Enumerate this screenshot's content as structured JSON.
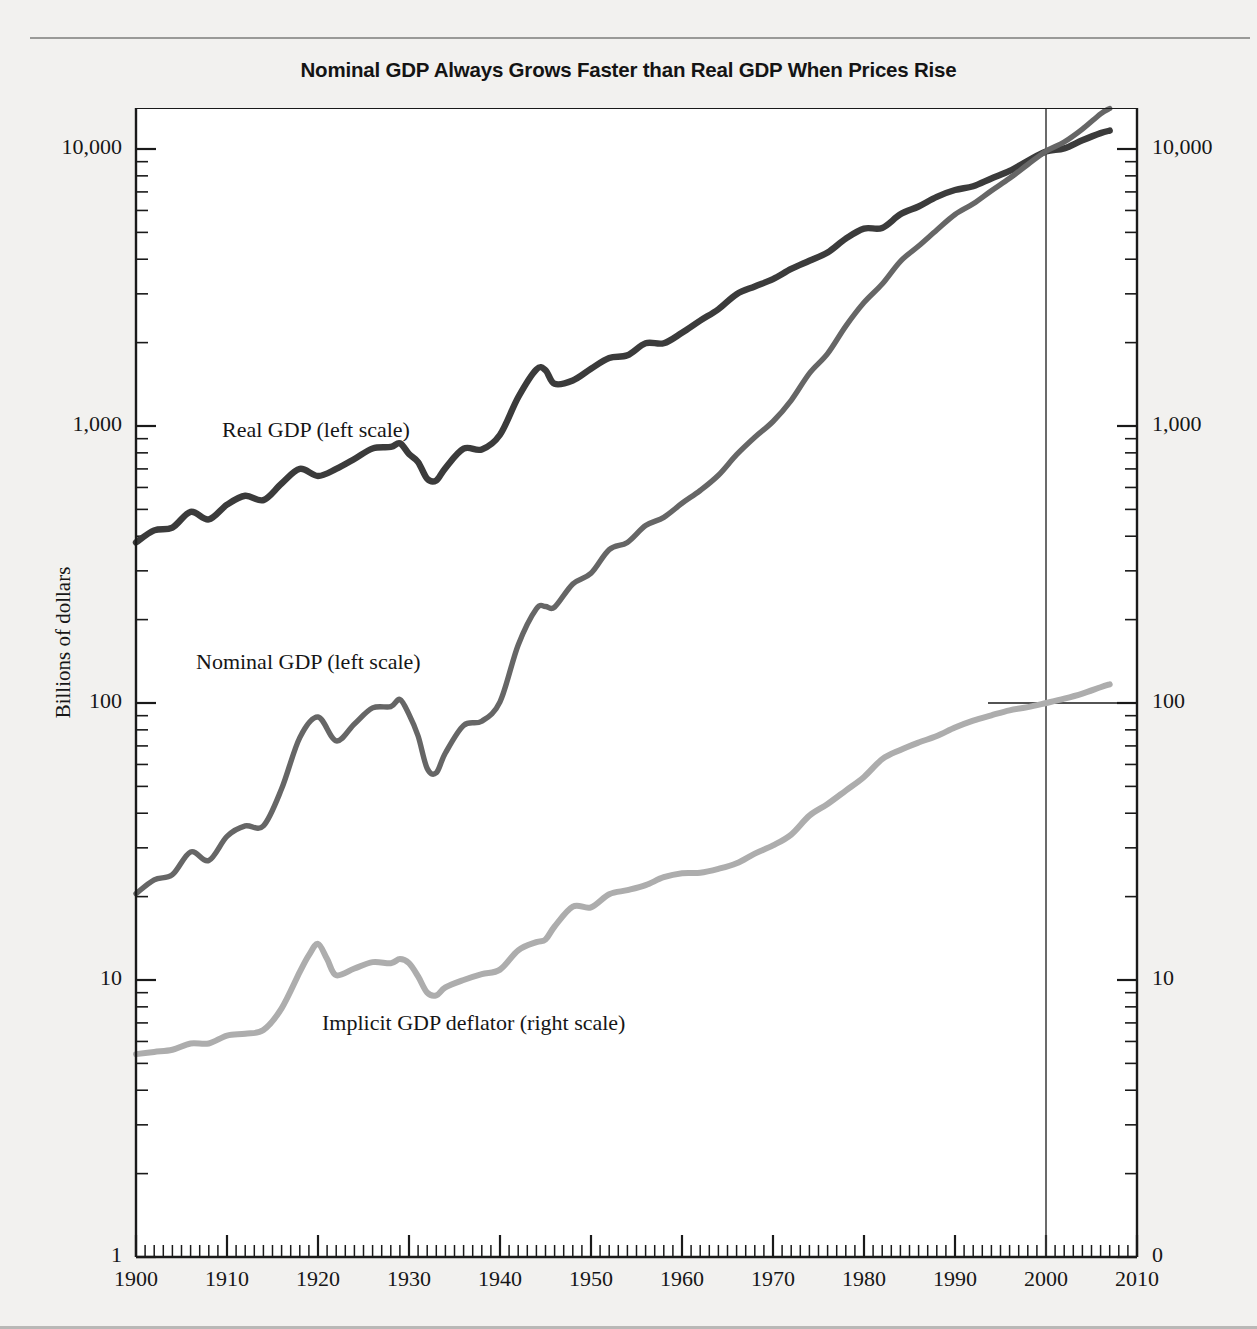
{
  "chart_data": {
    "type": "line",
    "title": "Nominal GDP Always Grows Faster than Real GDP When Prices Rise",
    "xlabel": "",
    "ylabel": "Billions of dollars",
    "ylabel_right": "Price index (the year 2000=100)",
    "x_scale": "linear",
    "y_scale": "log",
    "xlim": [
      1900,
      2010
    ],
    "ylim_left": [
      1,
      20000
    ],
    "ylim_right": [
      0,
      20000
    ],
    "grid": false,
    "legend_position": "inline-annotations",
    "xticks": [
      "1900",
      "1910",
      "1920",
      "1930",
      "1940",
      "1950",
      "1960",
      "1970",
      "1980",
      "1990",
      "2000",
      "2010"
    ],
    "xtick_values": [
      1900,
      1910,
      1920,
      1930,
      1940,
      1950,
      1960,
      1970,
      1980,
      1990,
      2000,
      2010
    ],
    "yticks_left": [
      "1",
      "10",
      "100",
      "1,000",
      "10,000"
    ],
    "ytick_values_left": [
      1,
      10,
      100,
      1000,
      10000
    ],
    "yticks_right": [
      "0",
      "10",
      "100",
      "1,000",
      "10,000"
    ],
    "ytick_values_right": [
      1,
      10,
      100,
      1000,
      10000
    ],
    "minor_ticks": "log decade subdivisions on both vertical axes; annual ticks on horizontal axis",
    "annotations": [
      {
        "name": "reference-line-2000",
        "type": "vline",
        "x": 2000,
        "label": ""
      },
      {
        "name": "reference-line-100",
        "type": "hline",
        "y": 100,
        "axis": "right",
        "label": ""
      }
    ],
    "series": [
      {
        "name": "Real GDP (left scale)",
        "label": "Real GDP (left scale)",
        "color": "#3b3b3b",
        "axis": "left",
        "units": "Billions of dollars",
        "x": [
          1900,
          1902,
          1904,
          1906,
          1908,
          1910,
          1912,
          1914,
          1916,
          1918,
          1920,
          1922,
          1924,
          1926,
          1928,
          1929,
          1930,
          1931,
          1932,
          1933,
          1934,
          1936,
          1938,
          1940,
          1942,
          1944,
          1945,
          1946,
          1948,
          1950,
          1952,
          1954,
          1956,
          1958,
          1960,
          1962,
          1964,
          1966,
          1968,
          1970,
          1972,
          1974,
          1976,
          1978,
          1980,
          1982,
          1984,
          1986,
          1988,
          1990,
          1992,
          1994,
          1996,
          1998,
          2000,
          2002,
          2004,
          2006,
          2007
        ],
        "y": [
          380,
          420,
          430,
          490,
          460,
          520,
          560,
          540,
          620,
          700,
          660,
          700,
          760,
          830,
          840,
          866,
          792,
          741,
          645,
          636,
          705,
          828,
          823,
          930,
          1270,
          1600,
          1590,
          1420,
          1460,
          1610,
          1760,
          1800,
          1990,
          1990,
          2170,
          2400,
          2640,
          2990,
          3190,
          3390,
          3690,
          3950,
          4230,
          4750,
          5160,
          5190,
          5810,
          6200,
          6720,
          7110,
          7340,
          7830,
          8330,
          9060,
          9800,
          10050,
          10750,
          11410,
          11650
        ]
      },
      {
        "name": "Nominal GDP (left scale)",
        "label": "Nominal GDP (left scale)",
        "color": "#666666",
        "axis": "left",
        "units": "Billions of dollars",
        "x": [
          1900,
          1902,
          1904,
          1906,
          1908,
          1910,
          1912,
          1914,
          1916,
          1918,
          1920,
          1922,
          1924,
          1926,
          1928,
          1929,
          1930,
          1931,
          1932,
          1933,
          1934,
          1936,
          1938,
          1940,
          1942,
          1944,
          1945,
          1946,
          1948,
          1950,
          1952,
          1954,
          1956,
          1958,
          1960,
          1962,
          1964,
          1966,
          1968,
          1970,
          1972,
          1974,
          1976,
          1978,
          1980,
          1982,
          1984,
          1986,
          1988,
          1990,
          1992,
          1994,
          1996,
          1998,
          2000,
          2002,
          2004,
          2006,
          2007
        ],
        "y": [
          20.5,
          23,
          24,
          29,
          27,
          33,
          36,
          36,
          49,
          75,
          89,
          73,
          84,
          96,
          97,
          103,
          91,
          76,
          58,
          56,
          66,
          83,
          86,
          101,
          162,
          219,
          223,
          222,
          269,
          294,
          358,
          380,
          437,
          468,
          526,
          585,
          664,
          788,
          911,
          1038,
          1238,
          1549,
          1825,
          2294,
          2790,
          3255,
          3933,
          4463,
          5100,
          5800,
          6340,
          7070,
          7840,
          8790,
          9820,
          10600,
          11800,
          13400,
          14000
        ]
      },
      {
        "name": "Implicit GDP deflator (right scale)",
        "label": "Implicit GDP deflator (right scale)",
        "color": "#adadad",
        "axis": "right",
        "units": "Index, 2000 = 100",
        "x": [
          1900,
          1902,
          1904,
          1906,
          1908,
          1910,
          1912,
          1914,
          1916,
          1918,
          1919,
          1920,
          1921,
          1922,
          1924,
          1926,
          1928,
          1929,
          1930,
          1931,
          1932,
          1933,
          1934,
          1936,
          1938,
          1940,
          1942,
          1944,
          1945,
          1946,
          1948,
          1950,
          1952,
          1954,
          1956,
          1958,
          1960,
          1962,
          1964,
          1966,
          1968,
          1970,
          1972,
          1974,
          1976,
          1978,
          1980,
          1982,
          1984,
          1986,
          1988,
          1990,
          1992,
          1994,
          1996,
          1998,
          2000,
          2002,
          2004,
          2006,
          2007
        ],
        "y": [
          5.4,
          5.5,
          5.6,
          5.9,
          5.9,
          6.3,
          6.4,
          6.6,
          7.9,
          10.7,
          12.3,
          13.5,
          11.9,
          10.4,
          11.0,
          11.6,
          11.5,
          11.9,
          11.5,
          10.3,
          9.0,
          8.8,
          9.4,
          10.0,
          10.5,
          10.9,
          12.8,
          13.7,
          14.0,
          15.6,
          18.4,
          18.3,
          20.4,
          21.1,
          22.0,
          23.5,
          24.3,
          24.4,
          25.2,
          26.4,
          28.6,
          30.6,
          33.5,
          39.2,
          43.2,
          48.3,
          54.1,
          62.7,
          67.7,
          72.0,
          76.0,
          81.6,
          86.4,
          90.3,
          94.1,
          96.6,
          100.0,
          103.7,
          108.2,
          114.0,
          116.8
        ]
      }
    ]
  },
  "axes": {
    "left": {
      "title": "Billions of dollars",
      "ticks": [
        {
          "value": 10000,
          "label": "10,000"
        },
        {
          "value": 1000,
          "label": "1,000"
        },
        {
          "value": 100,
          "label": "100"
        },
        {
          "value": 10,
          "label": "10"
        },
        {
          "value": 1,
          "label": "1"
        }
      ]
    },
    "right": {
      "title": "Price index (the year 2000=100)",
      "ticks": [
        {
          "value": 10000,
          "label": "10,000"
        },
        {
          "value": 1000,
          "label": "1,000"
        },
        {
          "value": 100,
          "label": "100"
        },
        {
          "value": 10,
          "label": "10"
        },
        {
          "value": 1,
          "label": "0"
        }
      ]
    },
    "bottom": {
      "ticks": [
        {
          "value": 1900,
          "label": "1900"
        },
        {
          "value": 1910,
          "label": "1910"
        },
        {
          "value": 1920,
          "label": "1920"
        },
        {
          "value": 1930,
          "label": "1930"
        },
        {
          "value": 1940,
          "label": "1940"
        },
        {
          "value": 1950,
          "label": "1950"
        },
        {
          "value": 1960,
          "label": "1960"
        },
        {
          "value": 1970,
          "label": "1970"
        },
        {
          "value": 1980,
          "label": "1980"
        },
        {
          "value": 1990,
          "label": "1990"
        },
        {
          "value": 2000,
          "label": "2000"
        },
        {
          "value": 2010,
          "label": "2010"
        }
      ]
    }
  },
  "annotations": {
    "real_gdp": "Real GDP (left scale)",
    "nominal_gdp": "Nominal GDP (left scale)",
    "deflator": "Implicit GDP deflator (right scale)"
  },
  "colors": {
    "page_background": "#f2f1ef",
    "plot_background": "#ffffff",
    "axis": "#1a1a1a",
    "real_gdp": "#3b3b3b",
    "nominal_gdp": "#666666",
    "deflator": "#adadad"
  }
}
